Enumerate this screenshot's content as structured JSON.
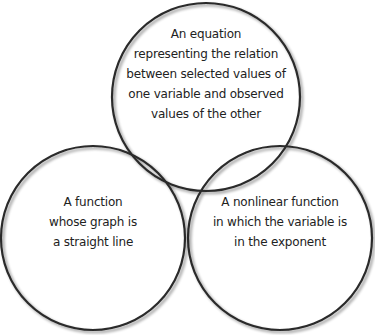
{
  "diagram": {
    "type": "venn",
    "stroke_color": "#2a2a2a",
    "fill_color": "#ffffff",
    "circles": [
      {
        "id": "top",
        "lines": [
          "An equation",
          "representing the relation",
          "between selected values of",
          "one variable and observed",
          "values of the other"
        ]
      },
      {
        "id": "left",
        "lines": [
          "A function",
          "whose graph is",
          "a straight line"
        ]
      },
      {
        "id": "right",
        "lines": [
          "A nonlinear function",
          "in which the variable is",
          "in the exponent"
        ]
      }
    ]
  }
}
